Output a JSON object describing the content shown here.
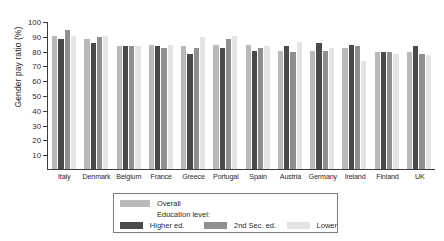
{
  "chart_data": {
    "type": "bar",
    "title": "",
    "xlabel": "",
    "ylabel": "Gender pay ratio (%)",
    "ylim": [
      0,
      100
    ],
    "yticks": [
      100,
      90,
      80,
      70,
      60,
      50,
      40,
      30,
      20,
      10
    ],
    "grid": false,
    "legend_position": "below-center",
    "categories": [
      "Italy",
      "Denmark",
      "Belgium",
      "France",
      "Greece",
      "Portugal",
      "Spain",
      "Austria",
      "Germany",
      "Ireland",
      "Finland",
      "UK"
    ],
    "series": [
      {
        "name": "Overall",
        "color": "#b9b9b9",
        "values": [
          90,
          88,
          83,
          84,
          83,
          84,
          84,
          80,
          80,
          82,
          79,
          79
        ]
      },
      {
        "name": "Higher ed.",
        "color": "#4a4a4a",
        "values": [
          88,
          85,
          83,
          83,
          78,
          82,
          80,
          83,
          85,
          84,
          79,
          83
        ]
      },
      {
        "name": "2nd Sec. ed.",
        "color": "#8f8f8f",
        "values": [
          94,
          89,
          83,
          82,
          82,
          88,
          82,
          79,
          80,
          83,
          79,
          78
        ]
      },
      {
        "name": "Lower",
        "color": "#e4e4e4",
        "values": [
          90,
          90,
          83,
          84,
          89,
          90,
          83,
          86,
          82,
          73,
          78,
          77
        ]
      }
    ],
    "legend": {
      "overall_label": "Overall",
      "education_header": "Education level:",
      "higher_label": "Higher ed.",
      "second_label": "2nd Sec. ed.",
      "lower_label": "Lower"
    }
  }
}
